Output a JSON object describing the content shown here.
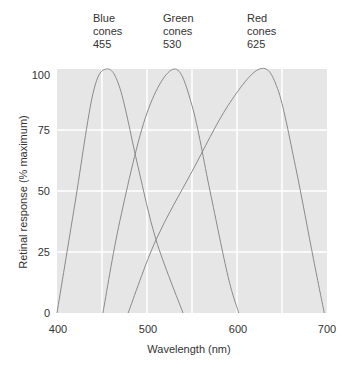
{
  "chart_data": {
    "type": "line",
    "title": "",
    "xlabel": "Wavelength (nm)",
    "ylabel": "Retinal response (% maximum)",
    "xlim": [
      400,
      700
    ],
    "ylim": [
      0,
      100
    ],
    "x_ticks": [
      "400",
      "500",
      "600",
      "700"
    ],
    "y_ticks": [
      "0",
      "25",
      "50",
      "75",
      "100"
    ],
    "grid": true,
    "series": [
      {
        "name": "Blue cones",
        "peak_nm": 455,
        "label_lines": [
          "Blue",
          "cones",
          "455"
        ],
        "points": [
          [
            400,
            0
          ],
          [
            420,
            45
          ],
          [
            440,
            90
          ],
          [
            455,
            100
          ],
          [
            470,
            92
          ],
          [
            490,
            60
          ],
          [
            510,
            30
          ],
          [
            540,
            0
          ]
        ]
      },
      {
        "name": "Green cones",
        "peak_nm": 530,
        "label_lines": [
          "Green",
          "cones",
          "530"
        ],
        "points": [
          [
            451,
            0
          ],
          [
            470,
            38
          ],
          [
            500,
            82
          ],
          [
            530,
            100
          ],
          [
            550,
            85
          ],
          [
            570,
            50
          ],
          [
            590,
            15
          ],
          [
            602,
            0
          ]
        ]
      },
      {
        "name": "Red cones",
        "peak_nm": 625,
        "label_lines": [
          "Red",
          "cones",
          "625"
        ],
        "points": [
          [
            479,
            0
          ],
          [
            510,
            30
          ],
          [
            550,
            58
          ],
          [
            590,
            85
          ],
          [
            625,
            100
          ],
          [
            645,
            92
          ],
          [
            665,
            60
          ],
          [
            685,
            22
          ],
          [
            697,
            0
          ]
        ]
      }
    ]
  },
  "annotations": {
    "blue": {
      "line1": "Blue",
      "line2": "cones",
      "line3": "455"
    },
    "green": {
      "line1": "Green",
      "line2": "cones",
      "line3": "530"
    },
    "red": {
      "line1": "Red",
      "line2": "cones",
      "line3": "625"
    }
  },
  "axes": {
    "xlabel": "Wavelength (nm)",
    "ylabel": "Retinal response (% maximum)",
    "x_ticks": [
      "400",
      "500",
      "600",
      "700"
    ],
    "y_ticks": [
      "0",
      "25",
      "50",
      "75",
      "100"
    ]
  },
  "colors": {
    "plot_bg": "#e6e6e6",
    "grid": "#ffffff",
    "curve": "#8a8a8a",
    "text": "#333333"
  }
}
